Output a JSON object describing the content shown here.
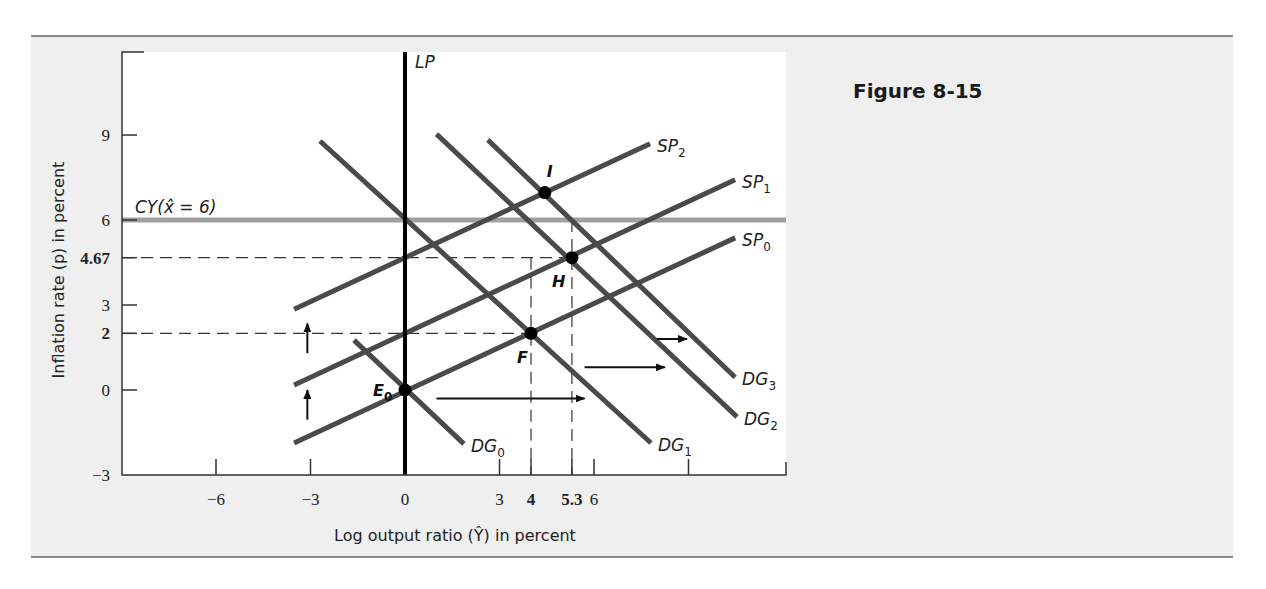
{
  "figure": {
    "title": "Figure 8-15"
  },
  "colors": {
    "frame_bg": "#efefef",
    "plot_bg": "#ffffff",
    "curve": "#4a4a4a",
    "cy_line": "#a0a0a0",
    "lp_line": "#000000",
    "axis": "#333333"
  },
  "chart_data": {
    "type": "line",
    "title": "Figure 8-15",
    "xlabel": "Log output ratio (Ŷ) in percent",
    "ylabel": "Inflation rate (p) in percent",
    "xlim": [
      -9,
      12
    ],
    "ylim": [
      -3,
      12
    ],
    "grid": false,
    "x_ticks": [
      {
        "value": -6,
        "label": "−6",
        "bold": false
      },
      {
        "value": -3,
        "label": "−3",
        "bold": false
      },
      {
        "value": 0,
        "label": "0",
        "bold": false
      },
      {
        "value": 3,
        "label": "3",
        "bold": false
      },
      {
        "value": 4,
        "label": "4",
        "bold": true
      },
      {
        "value": 5.3,
        "label": "5.3",
        "bold": true
      },
      {
        "value": 6,
        "label": "6",
        "bold": false
      },
      {
        "value": 9,
        "label": "",
        "bold": false
      }
    ],
    "y_ticks": [
      {
        "value": -3,
        "label": "−3",
        "bold": false
      },
      {
        "value": 0,
        "label": "0",
        "bold": false
      },
      {
        "value": 2,
        "label": "2",
        "bold": true
      },
      {
        "value": 3,
        "label": "3",
        "bold": false
      },
      {
        "value": 4.67,
        "label": "4.67",
        "bold": true
      },
      {
        "value": 6,
        "label": "6",
        "bold": false
      },
      {
        "value": 9,
        "label": "9",
        "bold": false
      }
    ],
    "series": [
      {
        "name": "LP",
        "label": "LP",
        "sub": "",
        "kind": "vertical",
        "x": 0,
        "y_range": [
          -3,
          12
        ]
      },
      {
        "name": "CY",
        "label": "CY(x̂ = 6)",
        "sub": "",
        "kind": "horizontal",
        "y": 6,
        "x_range": [
          -9,
          12
        ]
      },
      {
        "name": "SP0",
        "label": "SP",
        "sub": "0",
        "points": [
          [
            -3.52,
            -1.87
          ],
          [
            10.48,
            5.37
          ]
        ]
      },
      {
        "name": "SP1",
        "label": "SP",
        "sub": "1",
        "points": [
          [
            -3.52,
            0.18
          ],
          [
            10.48,
            7.42
          ]
        ]
      },
      {
        "name": "SP2",
        "label": "SP",
        "sub": "2",
        "points": [
          [
            -3.52,
            2.85
          ],
          [
            7.78,
            8.69
          ]
        ]
      },
      {
        "name": "DG0",
        "label": "DG",
        "sub": "0",
        "points": [
          [
            -1.62,
            1.76
          ],
          [
            1.87,
            -1.9
          ]
        ]
      },
      {
        "name": "DG1",
        "label": "DG",
        "sub": "1",
        "points": [
          [
            -2.7,
            8.79
          ],
          [
            7.81,
            -1.87
          ]
        ]
      },
      {
        "name": "DG2",
        "label": "DG",
        "sub": "2",
        "points": [
          [
            1.0,
            9.03
          ],
          [
            10.54,
            -0.95
          ]
        ]
      },
      {
        "name": "DG3",
        "label": "DG",
        "sub": "3",
        "points": [
          [
            2.63,
            8.83
          ],
          [
            10.48,
            0.45
          ]
        ]
      }
    ],
    "points": [
      {
        "name": "E0",
        "label": "E",
        "sub": "0",
        "x": 0,
        "y": 0
      },
      {
        "name": "F",
        "label": "F",
        "sub": "",
        "x": 4,
        "y": 2
      },
      {
        "name": "H",
        "label": "H",
        "sub": "",
        "x": 5.3,
        "y": 4.67
      },
      {
        "name": "I",
        "label": "I",
        "sub": "",
        "x": 4.44,
        "y": 6.97
      }
    ],
    "guides": [
      {
        "from": [
          -9,
          4.67
        ],
        "to": [
          5.3,
          4.67
        ]
      },
      {
        "from": [
          -9,
          2
        ],
        "to": [
          4,
          2
        ]
      },
      {
        "from": [
          4,
          4.67
        ],
        "to": [
          4,
          -3
        ]
      },
      {
        "from": [
          5.3,
          6
        ],
        "to": [
          5.3,
          -3
        ]
      }
    ],
    "annotations": [
      {
        "type": "arrow-up",
        "x": -3.1,
        "y_from": -1.05,
        "y_to": 0.0
      },
      {
        "type": "arrow-up",
        "x": -3.1,
        "y_from": 1.3,
        "y_to": 2.35
      },
      {
        "type": "arrow-right",
        "y": -0.3,
        "x_from": 1.0,
        "x_to": 5.7
      },
      {
        "type": "arrow-right",
        "y": 0.8,
        "x_from": 5.7,
        "x_to": 8.25
      },
      {
        "type": "arrow-right",
        "y": 1.8,
        "x_from": 8.0,
        "x_to": 8.95
      }
    ]
  }
}
